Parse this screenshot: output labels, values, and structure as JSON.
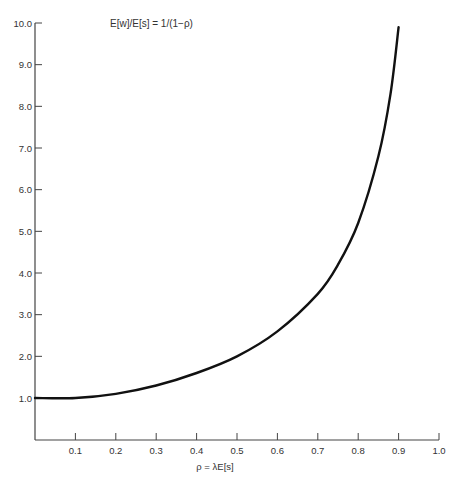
{
  "chart_data": {
    "type": "line",
    "title": "E[w]/E[s] = 1/(1−ρ)",
    "xlabel": "ρ = λE[s]",
    "ylabel": "",
    "xlim": [
      0,
      1.0
    ],
    "ylim": [
      0,
      10.0
    ],
    "grid": false,
    "x_ticks": [
      "0.1",
      "0.2",
      "0.3",
      "0.4",
      "0.5",
      "0.6",
      "0.7",
      "0.8",
      "0.9",
      "1.0"
    ],
    "y_ticks": [
      "1.0",
      "2.0",
      "3.0",
      "4.0",
      "5.0",
      "6.0",
      "7.0",
      "8.0",
      "9.0",
      "10.0"
    ],
    "series": [
      {
        "name": "E[w]/E[s]",
        "function": "1/(1-rho)",
        "x": [
          0.0,
          0.1,
          0.2,
          0.3,
          0.4,
          0.5,
          0.6,
          0.7,
          0.75,
          0.8,
          0.85,
          0.88,
          0.9
        ],
        "y": [
          1.0,
          1.0,
          1.1,
          1.3,
          1.6,
          2.0,
          2.6,
          3.5,
          4.2,
          5.2,
          6.8,
          8.3,
          9.9
        ]
      }
    ]
  }
}
